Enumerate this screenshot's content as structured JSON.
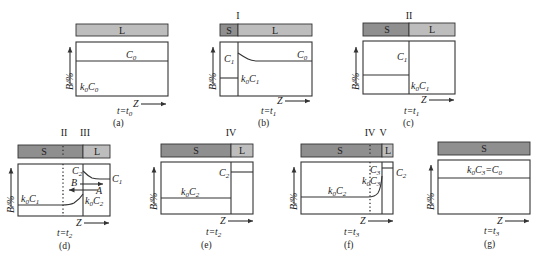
{
  "figure": {
    "panels": [
      {
        "id": "a",
        "caption": "(a)",
        "time": "t=t",
        "time_sub": "0",
        "bar": [
          {
            "phase": "L"
          }
        ],
        "labels": {
          "upper": "C",
          "upper_sub": "0",
          "lower_k": "k",
          "lower_k_sub": "0",
          "lower_c": "C",
          "lower_c_sub": "0"
        }
      },
      {
        "id": "b",
        "caption": "(b)",
        "time": "t=t",
        "time_sub": "1",
        "interface": "I",
        "bar": [
          {
            "phase": "S"
          },
          {
            "phase": "L"
          }
        ],
        "labels": {
          "solid": "C",
          "solid_sub": "1",
          "liquid": "C",
          "liquid_sub": "0",
          "k": "k",
          "k_sub": "0",
          "kc": "C",
          "kc_sub": "1"
        }
      },
      {
        "id": "c",
        "caption": "(c)",
        "time": "t=t",
        "time_sub": "1",
        "interface": "II",
        "bar": [
          {
            "phase": "S"
          },
          {
            "phase": "L"
          }
        ],
        "labels": {
          "upper": "C",
          "upper_sub": "1",
          "k": "k",
          "k_sub": "0",
          "kc": "C",
          "kc_sub": "1"
        }
      },
      {
        "id": "d",
        "caption": "(d)",
        "time": "t=t",
        "time_sub": "2",
        "interfaces": [
          "II",
          "III"
        ],
        "bar": [
          {
            "phase": "S"
          },
          {
            "phase": "L"
          }
        ],
        "labels": {
          "c2": "C",
          "c2_sub": "2",
          "c1": "C",
          "c1_sub": "1",
          "B": "B",
          "A": "A",
          "k1": "k",
          "k1_sub": "0",
          "kc1": "C",
          "kc1_sub": "1",
          "k2": "k",
          "k2_sub": "0",
          "kc2": "C",
          "kc2_sub": "2"
        }
      },
      {
        "id": "e",
        "caption": "(e)",
        "time": "t=t",
        "time_sub": "2",
        "interface": "IV",
        "bar": [
          {
            "phase": "S"
          },
          {
            "phase": "L"
          }
        ],
        "labels": {
          "c2": "C",
          "c2_sub": "2",
          "k": "k",
          "k_sub": "0",
          "kc": "C",
          "kc_sub": "2"
        }
      },
      {
        "id": "f",
        "caption": "(f)",
        "time": "t=t",
        "time_sub": "3",
        "interfaces": [
          "IV",
          "V"
        ],
        "bar": [
          {
            "phase": "S"
          },
          {
            "phase": "L"
          }
        ],
        "labels": {
          "c3": "C",
          "c3_sub": "3",
          "c2": "C",
          "c2_sub": "2",
          "k3": "k",
          "k3_sub": "0",
          "kc3": "C",
          "kc3_sub": "3",
          "k2": "k",
          "k2_sub": "0",
          "kc2": "C",
          "kc2_sub": "2"
        }
      },
      {
        "id": "g",
        "caption": "(g)",
        "time": "t=t",
        "time_sub": "3",
        "bar": [
          {
            "phase": "S"
          }
        ],
        "labels": {
          "k": "k",
          "k_sub": "0",
          "eq": "C",
          "eq_sub": "3",
          "eq_tail": "=C",
          "eq_tail_sub": "0"
        }
      }
    ],
    "axis": {
      "y_label": "B/%",
      "x_label": "Z"
    }
  }
}
